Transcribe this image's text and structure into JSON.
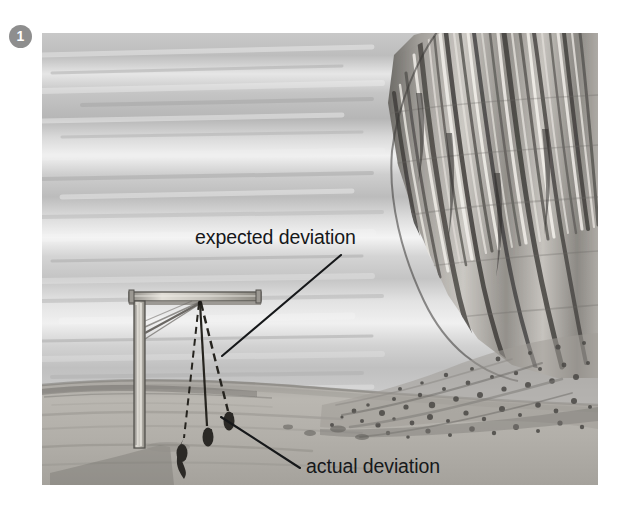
{
  "figure": {
    "number": "1",
    "badge_color": "#8e8e8e",
    "badge_text_color": "#ffffff"
  },
  "illustration": {
    "alt_name": "plumb-line-deflection-near-cliff",
    "style": "grayscale pencil and wash drawing",
    "frame": {
      "x": 42,
      "y": 33,
      "width": 556,
      "height": 452
    },
    "palette": {
      "sky_light": "#e9e9e9",
      "sky_mid": "#c3c3c3",
      "sky_dark": "#a9a9a9",
      "ground": "#b4b2ad",
      "ground_shadow": "#8e8c88",
      "cliff_light": "#d6d4d0",
      "cliff_mid": "#9a9894",
      "cliff_dark": "#4a4845",
      "ink": "#16181a",
      "wood": "#c9c6bf",
      "wood_shade": "#8b8883"
    }
  },
  "annotations": [
    {
      "id": "expected-deviation",
      "text": "expected deviation",
      "text_x": 195,
      "text_y": 227,
      "leader": {
        "x1": 341,
        "y1": 255,
        "x2": 222,
        "y2": 356
      }
    },
    {
      "id": "actual-deviation",
      "text": "actual deviation",
      "text_x": 306,
      "text_y": 456,
      "leader": {
        "x1": 300,
        "y1": 468,
        "x2": 221,
        "y2": 417
      }
    }
  ],
  "scene": {
    "structure_name": "plumb-line-support-frame",
    "beam": {
      "label": "horizontal beam"
    },
    "post": {
      "label": "vertical post"
    },
    "brace": {
      "label": "diagonal brace"
    },
    "plumb_lines": [
      {
        "name": "vertical-reference-line",
        "style": "solid",
        "bob_x": 180,
        "bob_y": 443
      },
      {
        "name": "actual-deviation-line",
        "style": "solid",
        "bob_x": 201,
        "bob_y": 432
      },
      {
        "name": "expected-deviation-line",
        "style": "dashed",
        "bob_x": 222,
        "bob_y": 418
      }
    ],
    "cliff_name": "escarpment-cliff-face",
    "talus_name": "talus-debris-slope",
    "horizon_name": "horizon-line"
  }
}
